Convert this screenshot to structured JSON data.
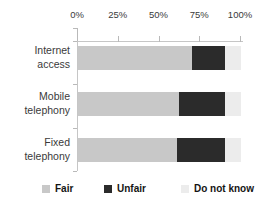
{
  "chart_data": {
    "type": "bar",
    "orientation": "horizontal",
    "stacked": true,
    "title": "",
    "categories": [
      "Internet access",
      "Mobile telephony",
      "Fixed telephony"
    ],
    "series": [
      {
        "name": "Fair",
        "color": "#c8c8c8",
        "values": [
          70,
          62,
          61
        ]
      },
      {
        "name": "Unfair",
        "color": "#2b2b2b",
        "values": [
          20,
          28,
          29
        ]
      },
      {
        "name": "Do not know",
        "color": "#ececec",
        "values": [
          10,
          10,
          10
        ]
      }
    ],
    "x_axis": {
      "position": "top",
      "range": [
        0,
        100
      ],
      "tick_labels": [
        "0%",
        "25%",
        "50%",
        "75%",
        "100%"
      ],
      "tick_values": [
        0,
        25,
        50,
        75,
        100
      ]
    },
    "legend": {
      "position": "bottom",
      "entries": [
        "Fair",
        "Unfair",
        "Do not know"
      ]
    },
    "colors": {
      "axis_line": "#c6c6c6",
      "tick_mark": "#b9b9b9",
      "label_text": "#3a3a3a",
      "legend_text": "#141414",
      "background": "#ffffff"
    }
  }
}
